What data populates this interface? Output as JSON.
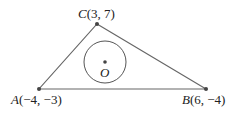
{
  "diagram": {
    "points": {
      "A": {
        "name": "A",
        "coords": "(−4, −3)",
        "x": -4,
        "y": -3,
        "px": 39,
        "py": 89
      },
      "B": {
        "name": "B",
        "coords": "(6, −4)",
        "x": 6,
        "y": -4,
        "px": 206,
        "py": 89
      },
      "C": {
        "name": "C",
        "coords": "(3, 7)",
        "x": 3,
        "y": 7,
        "px": 97,
        "py": 24
      }
    },
    "incircle": {
      "center_label": "O",
      "cx": 105,
      "cy": 62,
      "r": 21
    },
    "colors": {
      "line": "#555555",
      "point": "#444444",
      "text": "#222222"
    }
  }
}
